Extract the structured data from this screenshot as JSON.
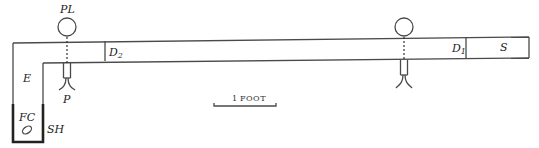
{
  "diagram": {
    "labels": {
      "pl": "PL",
      "e": "E",
      "fc": "FC",
      "sh": "SH",
      "p": "P",
      "d2_main": "D",
      "d2_sub": "2",
      "d1_main": "D",
      "d1_sub": "1",
      "s": "S"
    },
    "scale_bar": {
      "number": "1",
      "unit": "FOOT"
    }
  }
}
